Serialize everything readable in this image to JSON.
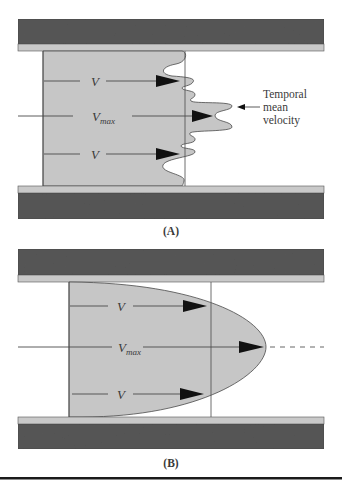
{
  "colors": {
    "wall_dark": "#565656",
    "wall_light": "#c9c9c9",
    "fluid": "#c6c6c6",
    "line": "#4a4a4a",
    "arrowhead": "#111111",
    "text": "#3a3a3a",
    "rule": "#1a1a1a"
  },
  "panel_a": {
    "label": "(A)",
    "flow_type": "turbulent",
    "arrow_labels": {
      "upper": "V",
      "center_main": "V",
      "center_sub": "max",
      "lower": "V"
    },
    "annotation": {
      "lines": [
        "Temporal",
        "mean",
        "velocity"
      ]
    }
  },
  "panel_b": {
    "label": "(B)",
    "flow_type": "laminar",
    "arrow_labels": {
      "upper": "V",
      "center_main": "V",
      "center_sub": "max",
      "lower": "V"
    }
  }
}
